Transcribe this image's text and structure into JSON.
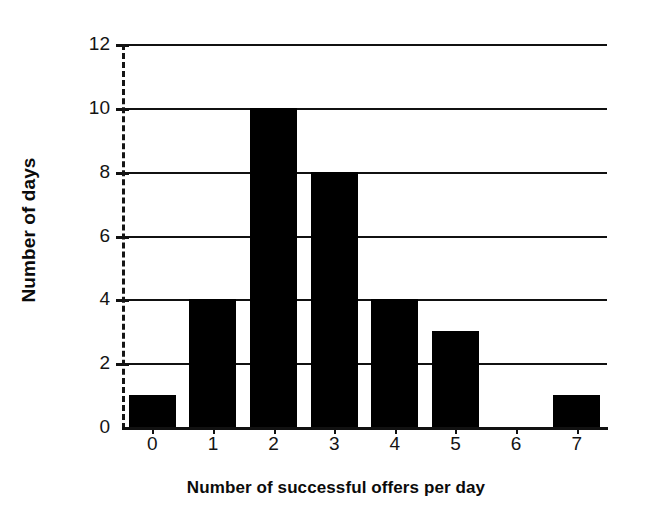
{
  "chart_data": {
    "type": "bar",
    "title": "",
    "subtitle": "",
    "xlabel": "Number of successful offers per day",
    "ylabel": "Number of days",
    "categories": [
      "0",
      "1",
      "2",
      "3",
      "4",
      "5",
      "6",
      "7"
    ],
    "values": [
      1,
      4,
      10,
      8,
      4,
      3,
      0,
      1
    ],
    "series": [
      {
        "name": "Number of days",
        "values": [
          1,
          4,
          10,
          8,
          4,
          3,
          0,
          1
        ]
      }
    ],
    "ylim": [
      0,
      12
    ],
    "ytick_labels": [
      "0",
      "2",
      "4",
      "6",
      "8",
      "10",
      "12"
    ],
    "ytick_values": [
      0,
      2,
      4,
      6,
      8,
      10,
      12
    ],
    "xtick_labels": [
      "0",
      "1",
      "2",
      "3",
      "4",
      "5",
      "6",
      "7"
    ],
    "grid": "horizontal",
    "legend": "none",
    "bar_color": "#000000",
    "axis_color": "#111111",
    "text_color": "#141414",
    "background_color": "#ffffff",
    "y_axis_style": "dashed",
    "annotations": []
  }
}
